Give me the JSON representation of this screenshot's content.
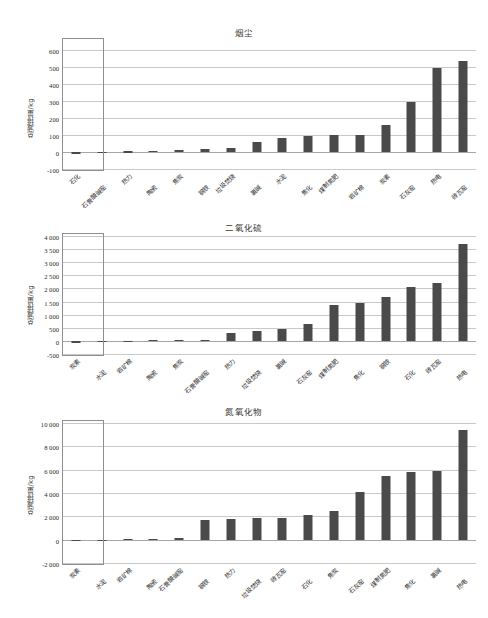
{
  "figure": {
    "ylabel": "总减排量/kg",
    "highlight_note": "first-category-callout-rectangle",
    "bar_color": "#4a4a4a",
    "grid_color": "#c9c9c9",
    "axis_color": "#9a9a9a"
  },
  "chart_data": [
    {
      "type": "bar",
      "title": "烟尘",
      "xlabel": "",
      "ylabel": "总减排量/kg",
      "ylim": [
        -100,
        650
      ],
      "yticks": [
        -100,
        0,
        100,
        200,
        300,
        400,
        500,
        600
      ],
      "ytick_labels": [
        "-100",
        "0",
        "100",
        "200",
        "300",
        "400",
        "500",
        "600"
      ],
      "grid": true,
      "categories": [
        "石化",
        "石膏酸碱窑",
        "热力",
        "陶瓷",
        "焦炭",
        "钢铁",
        "垃圾焚烧",
        "氯碱",
        "水泥",
        "焦化",
        "煤制氮肥",
        "岩矿棉",
        "炭素",
        "石灰窑",
        "热电",
        "砖瓦窑"
      ],
      "values": [
        -14,
        2,
        3,
        5,
        9,
        17,
        22,
        60,
        79,
        96,
        97,
        97,
        160,
        292,
        492,
        534
      ]
    },
    {
      "type": "bar",
      "title": "二氧化硫",
      "xlabel": "",
      "ylabel": "总减排量/kg",
      "ylim": [
        -500,
        4000
      ],
      "yticks": [
        -500,
        0,
        500,
        1000,
        1500,
        2000,
        2500,
        3000,
        3500,
        4000
      ],
      "ytick_labels": [
        "-500",
        "0",
        "500",
        "1 000",
        "1 500",
        "2 000",
        "2 500",
        "3 000",
        "3 500",
        "4 000"
      ],
      "grid": true,
      "categories": [
        "炭素",
        "水泥",
        "岩矿棉",
        "陶瓷",
        "焦炭",
        "石膏酸碱窑",
        "热力",
        "垃圾焚烧",
        "氯碱",
        "石灰窑",
        "煤制氮肥",
        "焦化",
        "钢铁",
        "石化",
        "砖瓦窑",
        "热电"
      ],
      "values": [
        -70,
        5,
        8,
        25,
        40,
        50,
        300,
        390,
        470,
        660,
        1360,
        1450,
        1680,
        2060,
        2200,
        3680
      ]
    },
    {
      "type": "bar",
      "title": "氮氧化物",
      "xlabel": "",
      "ylabel": "总减排量/kg",
      "ylim": [
        -2000,
        10000
      ],
      "yticks": [
        -2000,
        0,
        2000,
        4000,
        6000,
        8000,
        10000
      ],
      "ytick_labels": [
        "-2 000",
        "0",
        "2 000",
        "4 000",
        "6 000",
        "8 000",
        "10 000"
      ],
      "grid": true,
      "categories": [
        "炭素",
        "水泥",
        "岩矿棉",
        "陶瓷",
        "石膏酸碱窑",
        "钢铁",
        "热力",
        "垃圾焚烧",
        "砖瓦窑",
        "石化",
        "焦炭",
        "石灰窑",
        "煤制氮肥",
        "焦化",
        "氯碱",
        "热电"
      ],
      "values": [
        -60,
        10,
        60,
        60,
        150,
        1720,
        1780,
        1840,
        1900,
        2100,
        2500,
        4120,
        5460,
        5780,
        5880,
        9400
      ]
    }
  ]
}
